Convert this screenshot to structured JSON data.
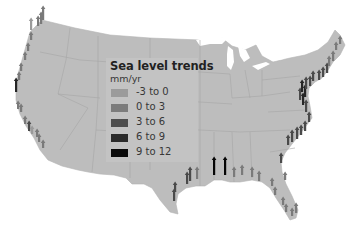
{
  "legend": {
    "title": "Sea level trends",
    "unit": "mm/yr",
    "items": [
      {
        "label": "-3 to 0",
        "color": "#9a9a9a"
      },
      {
        "label": "0 to 3",
        "color": "#7a7a7a"
      },
      {
        "label": "3 to 6",
        "color": "#4a4a4a"
      },
      {
        "label": "6 to 9",
        "color": "#262626"
      },
      {
        "label": "9 to 12",
        "color": "#050505"
      }
    ]
  },
  "map": {
    "land_color": "#bdbdbd",
    "border_color": "#a4a4a4",
    "water_color": "#ffffff",
    "arrows": [
      {
        "x": 31,
        "y": 30,
        "len": 12,
        "cat": 0
      },
      {
        "x": 38,
        "y": 26,
        "len": 10,
        "cat": 1
      },
      {
        "x": 41,
        "y": 24,
        "len": 12,
        "cat": 1
      },
      {
        "x": 43,
        "y": 20,
        "len": 14,
        "cat": 1
      },
      {
        "x": 31,
        "y": 40,
        "len": 8,
        "cat": 1
      },
      {
        "x": 28,
        "y": 51,
        "len": 8,
        "cat": 1
      },
      {
        "x": 25,
        "y": 60,
        "len": 8,
        "cat": 1
      },
      {
        "x": 21,
        "y": 71,
        "len": 8,
        "cat": 1
      },
      {
        "x": 19,
        "y": 80,
        "len": 8,
        "cat": 1
      },
      {
        "x": 16,
        "y": 92,
        "len": 14,
        "cat": 3
      },
      {
        "x": 18,
        "y": 109,
        "len": 8,
        "cat": 1
      },
      {
        "x": 21,
        "y": 112,
        "len": 8,
        "cat": 1
      },
      {
        "x": 25,
        "y": 124,
        "len": 8,
        "cat": 1
      },
      {
        "x": 29,
        "y": 131,
        "len": 10,
        "cat": 2
      },
      {
        "x": 32,
        "y": 134,
        "len": 8,
        "cat": 0
      },
      {
        "x": 37,
        "y": 137,
        "len": 8,
        "cat": 1
      },
      {
        "x": 39,
        "y": 142,
        "len": 8,
        "cat": 1
      },
      {
        "x": 43,
        "y": 148,
        "len": 8,
        "cat": 1
      },
      {
        "x": 174,
        "y": 201,
        "len": 12,
        "cat": 2
      },
      {
        "x": 175,
        "y": 192,
        "len": 10,
        "cat": 2
      },
      {
        "x": 187,
        "y": 184,
        "len": 12,
        "cat": 2
      },
      {
        "x": 190,
        "y": 181,
        "len": 14,
        "cat": 2
      },
      {
        "x": 197,
        "y": 179,
        "len": 12,
        "cat": 1
      },
      {
        "x": 214,
        "y": 175,
        "len": 18,
        "cat": 4
      },
      {
        "x": 225,
        "y": 175,
        "len": 18,
        "cat": 4
      },
      {
        "x": 234,
        "y": 177,
        "len": 10,
        "cat": 1
      },
      {
        "x": 242,
        "y": 175,
        "len": 10,
        "cat": 1
      },
      {
        "x": 252,
        "y": 177,
        "len": 10,
        "cat": 1
      },
      {
        "x": 259,
        "y": 181,
        "len": 10,
        "cat": 1
      },
      {
        "x": 272,
        "y": 186,
        "len": 8,
        "cat": 1
      },
      {
        "x": 275,
        "y": 195,
        "len": 8,
        "cat": 1
      },
      {
        "x": 283,
        "y": 205,
        "len": 8,
        "cat": 1
      },
      {
        "x": 286,
        "y": 212,
        "len": 8,
        "cat": 1
      },
      {
        "x": 292,
        "y": 216,
        "len": 8,
        "cat": 1
      },
      {
        "x": 296,
        "y": 213,
        "len": 10,
        "cat": 1
      },
      {
        "x": 285,
        "y": 180,
        "len": 8,
        "cat": 1
      },
      {
        "x": 281,
        "y": 163,
        "len": 10,
        "cat": 2
      },
      {
        "x": 288,
        "y": 145,
        "len": 10,
        "cat": 2
      },
      {
        "x": 292,
        "y": 142,
        "len": 12,
        "cat": 2
      },
      {
        "x": 297,
        "y": 139,
        "len": 12,
        "cat": 2
      },
      {
        "x": 301,
        "y": 135,
        "len": 10,
        "cat": 2
      },
      {
        "x": 305,
        "y": 131,
        "len": 10,
        "cat": 2
      },
      {
        "x": 309,
        "y": 122,
        "len": 10,
        "cat": 2
      },
      {
        "x": 306,
        "y": 112,
        "len": 12,
        "cat": 2
      },
      {
        "x": 303,
        "y": 105,
        "len": 12,
        "cat": 3
      },
      {
        "x": 300,
        "y": 100,
        "len": 12,
        "cat": 2
      },
      {
        "x": 305,
        "y": 97,
        "len": 12,
        "cat": 3
      },
      {
        "x": 302,
        "y": 92,
        "len": 12,
        "cat": 3
      },
      {
        "x": 306,
        "y": 89,
        "len": 12,
        "cat": 2
      },
      {
        "x": 310,
        "y": 86,
        "len": 10,
        "cat": 2
      },
      {
        "x": 313,
        "y": 81,
        "len": 10,
        "cat": 2
      },
      {
        "x": 319,
        "y": 80,
        "len": 10,
        "cat": 2
      },
      {
        "x": 323,
        "y": 77,
        "len": 10,
        "cat": 2
      },
      {
        "x": 327,
        "y": 73,
        "len": 10,
        "cat": 2
      },
      {
        "x": 329,
        "y": 66,
        "len": 10,
        "cat": 1
      },
      {
        "x": 333,
        "y": 61,
        "len": 10,
        "cat": 1
      },
      {
        "x": 336,
        "y": 50,
        "len": 8,
        "cat": 1
      },
      {
        "x": 340,
        "y": 44,
        "len": 8,
        "cat": 1
      }
    ]
  }
}
